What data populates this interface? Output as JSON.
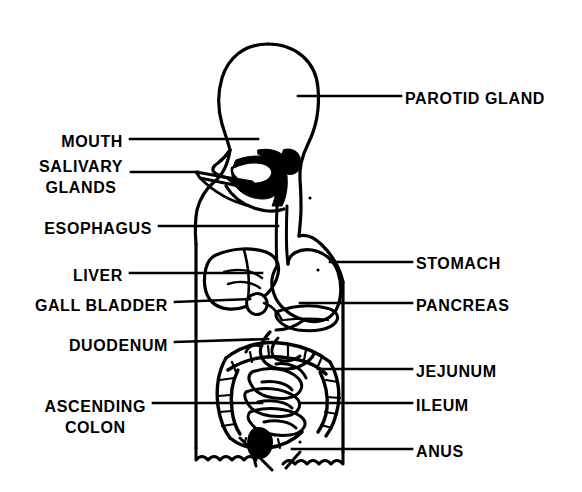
{
  "diagram": {
    "view": "side profile schematic line drawing",
    "style": {
      "ink": "#000000",
      "background": "#ffffff"
    },
    "labels_left": [
      {
        "id": "mouth",
        "text": "MOUTH",
        "text_x": 123,
        "text_y": 143,
        "leader": {
          "x1": 130,
          "y1": 139,
          "x2": 258,
          "y2": 139
        }
      },
      {
        "id": "salivary-glands",
        "line1": "SALIVARY",
        "line2": "GLANDS",
        "text_x": 123,
        "text_y": 166,
        "leader": {
          "x1": 131,
          "y1": 172,
          "x2": 196,
          "y2": 172
        }
      },
      {
        "id": "esophagus",
        "text": "ESOPHAGUS",
        "text_x": 152,
        "text_y": 230,
        "leader": {
          "x1": 159,
          "y1": 226,
          "x2": 278,
          "y2": 226
        }
      },
      {
        "id": "liver",
        "text": "LIVER",
        "text_x": 123,
        "text_y": 277,
        "leader": {
          "x1": 130,
          "y1": 273,
          "x2": 262,
          "y2": 273
        }
      },
      {
        "id": "gall-bladder",
        "text": "GALL BLADDER",
        "text_x": 168,
        "text_y": 307,
        "leader": {
          "x1": 175,
          "y1": 302,
          "x2": 258,
          "y2": 297
        }
      },
      {
        "id": "duodenum",
        "text": "DUODENUM",
        "text_x": 168,
        "text_y": 347,
        "leader": {
          "x1": 175,
          "y1": 342,
          "x2": 268,
          "y2": 339
        }
      },
      {
        "id": "ascending-colon",
        "line1": "ASCENDING",
        "line2": "COLON",
        "text_x": 146,
        "text_y": 398,
        "leader": {
          "x1": 153,
          "y1": 403,
          "x2": 262,
          "y2": 403
        }
      }
    ],
    "labels_right": [
      {
        "id": "parotid-gland",
        "text": "PAROTID GLAND",
        "text_x": 405,
        "text_y": 100,
        "leader": {
          "x1": 300,
          "y1": 96,
          "x2": 401,
          "y2": 96
        }
      },
      {
        "id": "stomach",
        "text": "STOMACH",
        "text_x": 416,
        "text_y": 265,
        "leader": {
          "x1": 330,
          "y1": 262,
          "x2": 412,
          "y2": 262
        }
      },
      {
        "id": "pancreas",
        "text": "PANCREAS",
        "text_x": 416,
        "text_y": 307,
        "leader": {
          "x1": 300,
          "y1": 303,
          "x2": 412,
          "y2": 303
        }
      },
      {
        "id": "jejunum",
        "text": "JEJUNUM",
        "text_x": 416,
        "text_y": 373,
        "leader": {
          "x1": 320,
          "y1": 369,
          "x2": 412,
          "y2": 369
        }
      },
      {
        "id": "ileum",
        "text": "ILEUM",
        "text_x": 416,
        "text_y": 407,
        "leader": {
          "x1": 300,
          "y1": 403,
          "x2": 412,
          "y2": 403
        }
      },
      {
        "id": "anus",
        "text": "ANUS",
        "text_x": 416,
        "text_y": 453,
        "leader": {
          "x1": 300,
          "y1": 449,
          "x2": 412,
          "y2": 449
        }
      }
    ],
    "organs": [
      "mouth",
      "salivary glands",
      "parotid gland",
      "esophagus",
      "stomach",
      "liver",
      "gall bladder",
      "pancreas",
      "duodenum",
      "jejunum",
      "ileum",
      "ascending colon",
      "anus"
    ]
  }
}
